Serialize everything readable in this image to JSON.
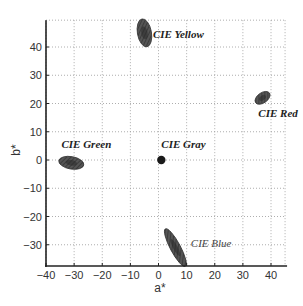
{
  "chart_data": {
    "type": "scatter",
    "title": "",
    "xlabel": "a*",
    "ylabel": "b*",
    "xlim": [
      -40,
      45
    ],
    "ylim": [
      -37.5,
      49.5
    ],
    "xticks": [
      -40,
      -30,
      -20,
      -10,
      0,
      10,
      20,
      30,
      40
    ],
    "yticks": [
      -30,
      -20,
      -10,
      0,
      10,
      20,
      30,
      40
    ],
    "grid": true,
    "legend": "none",
    "series": [
      {
        "name": "CIE Yellow",
        "a": -5,
        "b": 45,
        "rx": 2.5,
        "ry": 5,
        "angle": -10,
        "label_weight": "bold"
      },
      {
        "name": "CIE Red",
        "a": 37,
        "b": 22,
        "rx": 3,
        "ry": 1.8,
        "angle": -35,
        "label_weight": "bold"
      },
      {
        "name": "CIE Green",
        "a": -31,
        "b": -1,
        "rx": 4.5,
        "ry": 2.2,
        "angle": 10,
        "label_weight": "bold"
      },
      {
        "name": "CIE Gray",
        "a": 1,
        "b": 0,
        "rx": 1,
        "ry": 1,
        "angle": 0,
        "label_weight": "bold"
      },
      {
        "name": "CIE Blue",
        "a": 6,
        "b": -31,
        "rx": 1.8,
        "ry": 7.5,
        "angle": -28,
        "label_weight": "normal"
      }
    ],
    "annotations": [
      {
        "text": "CIE Yellow",
        "a": -2,
        "b": 44.5
      },
      {
        "text": "CIE Red",
        "a": 35.5,
        "b": 16.5
      },
      {
        "text": "CIE Green",
        "a": -34.5,
        "b": 5.5
      },
      {
        "text": "CIE Gray",
        "a": 1,
        "b": 5.5
      },
      {
        "text": "CIE Blue",
        "a": 11.5,
        "b": -29.5
      }
    ]
  }
}
